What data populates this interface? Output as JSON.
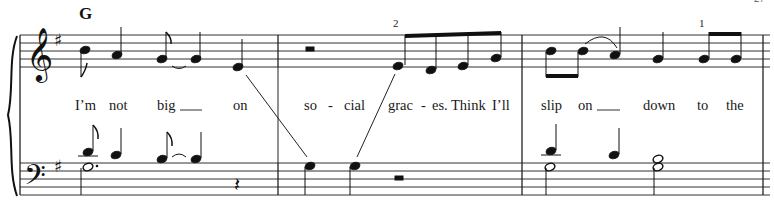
{
  "page": {
    "page_number": "27",
    "key_signature": "G major (1 sharp)",
    "colors": {
      "ink": "#111111",
      "staff": "#333333",
      "paper": "#ffffff"
    }
  },
  "system": {
    "clefs": {
      "upper": "treble-clef",
      "lower": "bass-clef"
    },
    "chord_symbols": [
      {
        "label": "G",
        "measure": 1
      }
    ],
    "fingerings": [
      {
        "label": "2",
        "measure": 2
      },
      {
        "label": "1",
        "measure": 3
      }
    ],
    "lyrics": {
      "measure1": [
        "I’m",
        "not",
        "big",
        "on"
      ],
      "measure2": [
        "so",
        "-",
        "cial",
        "grac",
        "-",
        "es.",
        "Think",
        "I’ll"
      ],
      "measure3": [
        "slip",
        "on",
        "down",
        "to",
        "the"
      ]
    },
    "measures": [
      {
        "number": 1,
        "treble": [
          "B4 eighth",
          "A4 quarter",
          "G4 eighth (tied)",
          "G4 quarter",
          "E4 quarter"
        ],
        "bass": [
          "B3 eighth / G3 dotted half",
          "A3 quarter",
          "G3 eighth (tied)",
          "G3 quarter",
          "quarter rest"
        ]
      },
      {
        "number": 2,
        "treble": [
          "half rest",
          "E4 eighth",
          "D4 eighth",
          "E4 eighth",
          "G4 eighth"
        ],
        "bass": [
          "G3 quarter",
          "G3 quarter",
          "half rest"
        ]
      },
      {
        "number": 3,
        "treble": [
          "B4 eighth",
          "B4 eighth (tied)",
          "A4 quarter",
          "G4 quarter",
          "G4 eighth",
          "G4 eighth"
        ],
        "bass": [
          "B3 quarter / G3 half",
          "A3 quarter",
          "G3+B3 half"
        ]
      }
    ]
  }
}
